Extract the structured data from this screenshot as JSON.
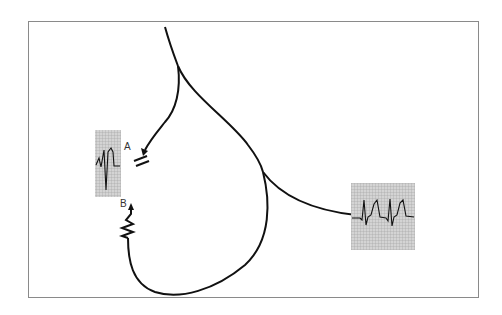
{
  "figure": {
    "type": "conduction pathway diagram",
    "labels": {
      "a": "A",
      "b": "B"
    },
    "insets": [
      {
        "name": "left-ecg-strip",
        "description": "ECG trace with single complex"
      },
      {
        "name": "right-ecg-strip",
        "description": "ECG trace with two complexes"
      }
    ],
    "colors": {
      "line": "#111111",
      "frame": "#8a8a8a",
      "grid_bg": "#c8c8c8",
      "grid_line": "#9a9a9a"
    }
  }
}
